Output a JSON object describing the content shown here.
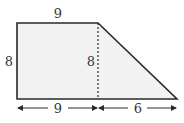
{
  "diagram": {
    "type": "trapezoid",
    "fill_color": "#f2f2f2",
    "stroke_color": "#2a2a2a",
    "labels": {
      "top": "9",
      "left": "8",
      "height": "8",
      "bottom_left": "9",
      "bottom_right": "6"
    },
    "dimensions": {
      "top_base": 9,
      "bottom_base": 15,
      "height": 8,
      "rectangle_width": 9,
      "triangle_base": 6
    }
  }
}
